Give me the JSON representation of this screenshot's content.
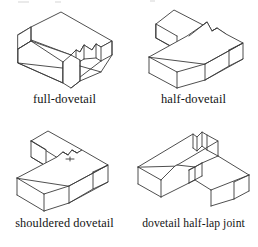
{
  "figure": {
    "kind": "line-drawing-plate",
    "background_color": "#ffffff",
    "line_color": "#3b3b3b",
    "text_color": "#141414",
    "panels": [
      {
        "id": "full-dovetail",
        "caption": "full-dovetail",
        "description": "single rectangular beam shown in isometric view with a dovetail socket cut into its right end"
      },
      {
        "id": "half-dovetail",
        "caption": "half-dovetail",
        "description": "T-shaped assembly of two beams joined by a half dovetail"
      },
      {
        "id": "shouldered-dovetail",
        "caption": "shouldered dovetail",
        "description": "T-shaped assembly of two beams joined by a shouldered dovetail"
      },
      {
        "id": "dovetail-half-lap-joint",
        "caption": "dovetail half-lap joint",
        "description": "two beams crossing with a dovetail half-lap cut"
      }
    ]
  }
}
